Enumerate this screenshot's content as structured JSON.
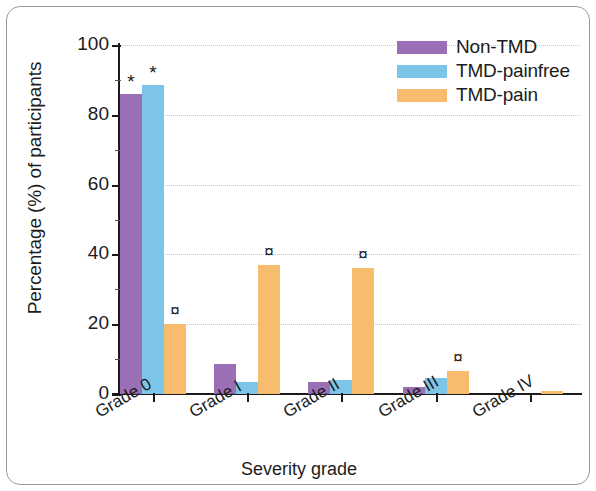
{
  "chart_data": {
    "type": "bar",
    "title": "",
    "xlabel": "Severity grade",
    "ylabel": "Percentage (%) of participants",
    "ylim": [
      0,
      100
    ],
    "yticks": [
      0,
      20,
      40,
      60,
      80,
      100
    ],
    "grid": true,
    "legend_position": "top-right",
    "categories": [
      "Grade 0",
      "Grade I",
      "Grade II",
      "Grade III",
      "Grade IV"
    ],
    "series": [
      {
        "name": "Non-TMD",
        "color": "#9b6fb5",
        "values": [
          86,
          8.5,
          3.5,
          2,
          0
        ],
        "markers": [
          "*",
          "",
          "",
          "",
          ""
        ]
      },
      {
        "name": "TMD-painfree",
        "color": "#7cc4e8",
        "values": [
          88.5,
          3.5,
          4,
          4.5,
          0
        ],
        "markers": [
          "*",
          "",
          "",
          "",
          ""
        ]
      },
      {
        "name": "TMD-pain",
        "color": "#f7bc6e",
        "values": [
          20,
          37,
          36,
          6.5,
          1
        ],
        "markers": [
          "¤",
          "¤",
          "¤",
          "¤",
          ""
        ]
      }
    ]
  },
  "axes": {
    "y_title": "Percentage (%) of participants",
    "x_title": "Severity grade",
    "y_tick_labels": [
      "100",
      "80",
      "60",
      "40",
      "20",
      "0"
    ],
    "x_tick_labels": [
      "Grade 0",
      "Grade I",
      "Grade II",
      "Grade III",
      "Grade IV"
    ]
  },
  "legend": {
    "items": [
      {
        "label": "Non-TMD",
        "color": "#9b6fb5"
      },
      {
        "label": "TMD-painfree",
        "color": "#7cc4e8"
      },
      {
        "label": "TMD-pain",
        "color": "#f7bc6e"
      }
    ]
  }
}
